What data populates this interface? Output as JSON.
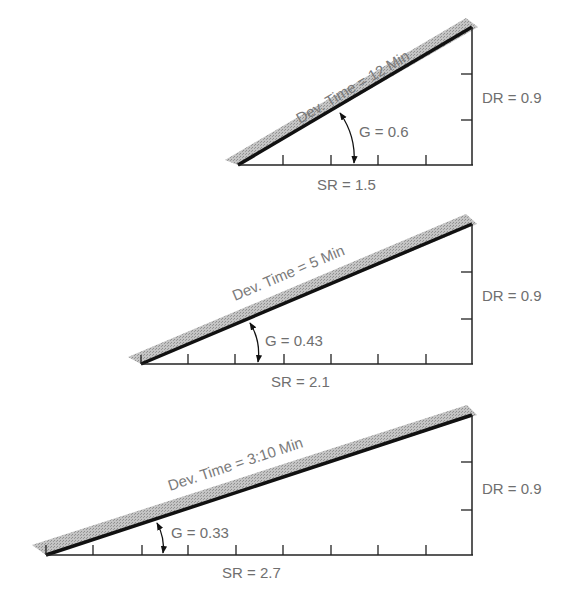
{
  "figure": {
    "colors": {
      "line": "#111111",
      "band": "#b3b3b3",
      "text": "#6f6f6f"
    },
    "triangles": [
      {
        "dev_time_label": "Dev. Time = 12 Min",
        "gradient_label": "G = 0.6",
        "sr_label": "SR = 1.5",
        "dr_label": "DR = 0.9",
        "sr": 1.5,
        "dr": 0.9,
        "g": 0.6,
        "dev_time": "12 Min"
      },
      {
        "dev_time_label": "Dev. Time = 5 Min",
        "gradient_label": "G = 0.43",
        "sr_label": "SR = 2.1",
        "dr_label": "DR = 0.9",
        "sr": 2.1,
        "dr": 0.9,
        "g": 0.43,
        "dev_time": "5 Min"
      },
      {
        "dev_time_label": "Dev. Time = 3:10 Min",
        "gradient_label": "G = 0.33",
        "sr_label": "SR = 2.7",
        "dr_label": "DR = 0.9",
        "sr": 2.7,
        "dr": 0.9,
        "g": 0.33,
        "dev_time": "3:10 Min"
      }
    ]
  }
}
